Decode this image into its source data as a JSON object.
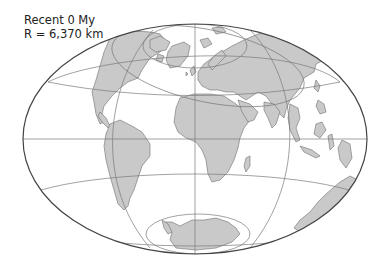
{
  "map": {
    "title_line1": "Recent 0 My",
    "title_line2": "R = 6,370 km",
    "projection": "hammer-aitoff-like elliptical world projection",
    "colors": {
      "land": "#c9c9c9",
      "coastline": "#6e6e6e",
      "graticule": "#7a7a7a",
      "outline": "#444444",
      "ocean": "#ffffff"
    },
    "features": [
      "North America",
      "South America",
      "Greenland",
      "Europe",
      "Africa",
      "Asia",
      "Arabia",
      "India",
      "Southeast Asia",
      "Australia",
      "Antarctica",
      "Madagascar",
      "Japan",
      "Indonesia"
    ]
  }
}
